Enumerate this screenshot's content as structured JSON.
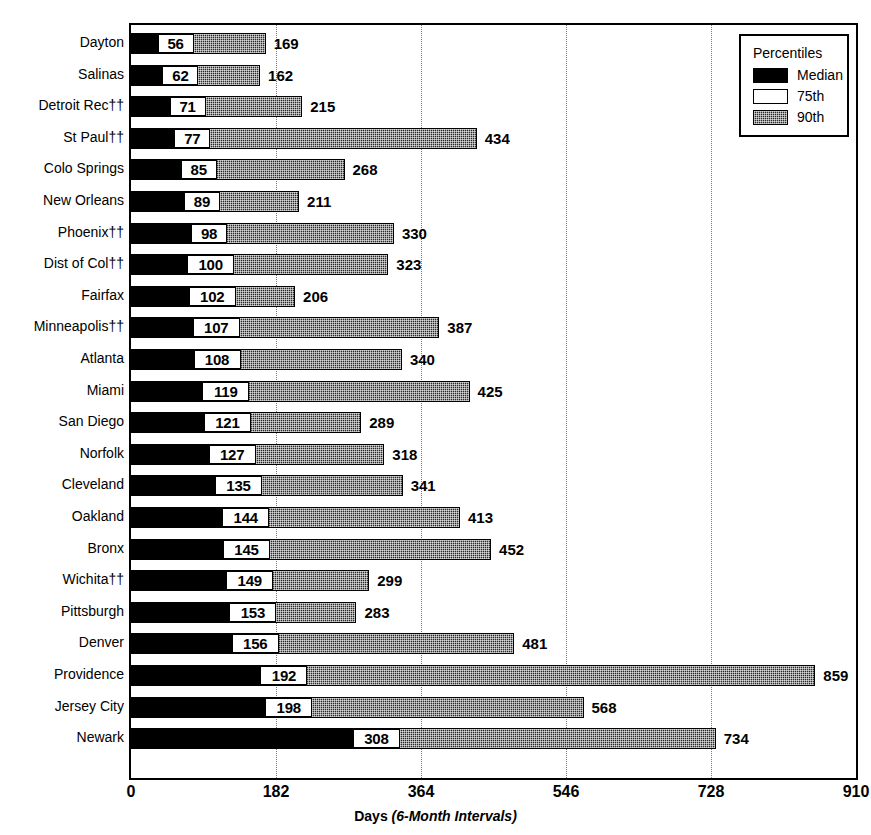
{
  "chart_data": {
    "type": "bar",
    "title": "",
    "subtitle": "",
    "xlabel_bold": "Days",
    "xlabel_italic": "(6-Month Intervals)",
    "ylabel": "",
    "xlim": [
      0,
      910
    ],
    "xticks": [
      0,
      182,
      364,
      546,
      728,
      910
    ],
    "xtick_labels": [
      "0",
      "182",
      "364",
      "546",
      "728",
      "910"
    ],
    "grid": "vertical-dotted",
    "orientation": "horizontal",
    "legend_position": "top-right",
    "categories": [
      "Dayton",
      "Salinas",
      "Detroit Rec††",
      "St Paul††",
      "Colo Springs",
      "New Orleans",
      "Phoenix††",
      "Dist of Col††",
      "Fairfax",
      "Minneapolis††",
      "Atlanta",
      "Miami",
      "San Diego",
      "Norfolk",
      "Cleveland",
      "Oakland",
      "Bronx",
      "Wichita††",
      "Pittsburgh",
      "Denver",
      "Providence",
      "Jersey City",
      "Newark"
    ],
    "series": [
      {
        "name": "Median",
        "values": [
          56,
          62,
          71,
          77,
          85,
          89,
          98,
          100,
          102,
          107,
          108,
          119,
          121,
          127,
          135,
          144,
          145,
          149,
          153,
          156,
          192,
          198,
          308
        ]
      },
      {
        "name": "90th",
        "values": [
          169,
          162,
          215,
          434,
          268,
          211,
          330,
          323,
          206,
          387,
          340,
          425,
          289,
          318,
          341,
          413,
          452,
          299,
          283,
          481,
          859,
          568,
          734
        ]
      }
    ],
    "rows": [
      {
        "label": "Dayton",
        "median": 56,
        "p90": 169
      },
      {
        "label": "Salinas",
        "median": 62,
        "p90": 162
      },
      {
        "label": "Detroit Rec††",
        "median": 71,
        "p90": 215
      },
      {
        "label": "St Paul††",
        "median": 77,
        "p90": 434
      },
      {
        "label": "Colo Springs",
        "median": 85,
        "p90": 268
      },
      {
        "label": "New Orleans",
        "median": 89,
        "p90": 211
      },
      {
        "label": "Phoenix††",
        "median": 98,
        "p90": 330
      },
      {
        "label": "Dist of Col††",
        "median": 100,
        "p90": 323
      },
      {
        "label": "Fairfax",
        "median": 102,
        "p90": 206
      },
      {
        "label": "Minneapolis††",
        "median": 107,
        "p90": 387
      },
      {
        "label": "Atlanta",
        "median": 108,
        "p90": 340
      },
      {
        "label": "Miami",
        "median": 119,
        "p90": 425
      },
      {
        "label": "San Diego",
        "median": 121,
        "p90": 289
      },
      {
        "label": "Norfolk",
        "median": 127,
        "p90": 318
      },
      {
        "label": "Cleveland",
        "median": 135,
        "p90": 341
      },
      {
        "label": "Oakland",
        "median": 144,
        "p90": 413
      },
      {
        "label": "Bronx",
        "median": 145,
        "p90": 452
      },
      {
        "label": "Wichita††",
        "median": 149,
        "p90": 299
      },
      {
        "label": "Pittsburgh",
        "median": 153,
        "p90": 283
      },
      {
        "label": "Denver",
        "median": 156,
        "p90": 481
      },
      {
        "label": "Providence",
        "median": 192,
        "p90": 859
      },
      {
        "label": "Jersey City",
        "median": 198,
        "p90": 568
      },
      {
        "label": "Newark",
        "median": 308,
        "p90": 734
      }
    ],
    "colors": {
      "median": "#000000",
      "p75": "#ffffff",
      "p90": "#2b2b2b",
      "axis": "#000000",
      "grid": "#7a7a7a"
    }
  },
  "legend": {
    "title": "Percentiles",
    "items": [
      {
        "label": "Median",
        "swatch": "median"
      },
      {
        "label": "75th",
        "swatch": "p75"
      },
      {
        "label": "90th",
        "swatch": "p90"
      }
    ]
  }
}
